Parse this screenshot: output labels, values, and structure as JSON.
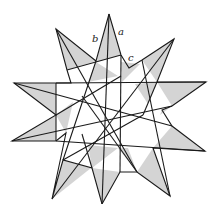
{
  "figure": {
    "labels": {
      "a": "a",
      "b": "b",
      "c": "c"
    },
    "colors": {
      "shade": "#d4d4d4",
      "line": "#1a1a1a",
      "background": "#ffffff"
    }
  }
}
